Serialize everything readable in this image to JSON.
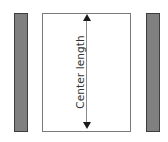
{
  "diagram": {
    "label": "Center length",
    "colors": {
      "bar_fill": "#808080",
      "bar_border": "#3d3d3d",
      "rect_border": "#7a7a7a",
      "arrow": "#1a1a1a",
      "text": "#333333"
    },
    "elements": [
      {
        "type": "bar",
        "position": "left"
      },
      {
        "type": "rectangle",
        "position": "center"
      },
      {
        "type": "bar",
        "position": "right"
      }
    ],
    "dimension": {
      "orientation": "vertical",
      "arrows": "both-ends"
    }
  }
}
